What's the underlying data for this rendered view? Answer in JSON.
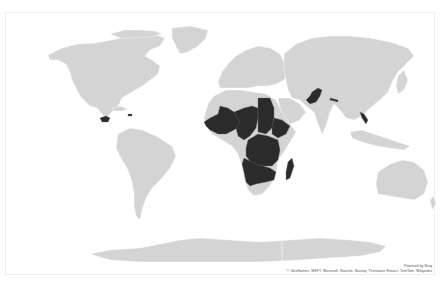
{
  "map": {
    "type": "world-choropleth",
    "provider_label": "Powered by Bing",
    "copyright": "© GeoNames, MSFT, Microsoft, Navinfo, Navteq, Thinkware Extract, TomTom, Wikipedia",
    "colors": {
      "background": "#ffffff",
      "land": "#d4d4d4",
      "highlighted": "#2b2b2b",
      "border": "#ffffff"
    },
    "highlighted_regions": [
      "Guatemala",
      "Honduras",
      "Haiti",
      "Senegal",
      "Gambia",
      "Guinea-Bissau",
      "Guinea",
      "Sierra Leone",
      "Liberia",
      "Mali",
      "Burkina Faso",
      "Togo",
      "Benin",
      "Niger",
      "Nigeria",
      "Chad",
      "Sudan",
      "South Sudan",
      "Eritrea",
      "Ethiopia",
      "Central African Republic",
      "Cameroon",
      "Democratic Republic of the Congo",
      "Uganda",
      "Kenya",
      "Rwanda",
      "Burundi",
      "Tanzania",
      "Angola",
      "Zambia",
      "Malawi",
      "Mozambique",
      "Zimbabwe",
      "Namibia",
      "Madagascar",
      "Pakistan",
      "Nepal",
      "Laos"
    ]
  }
}
